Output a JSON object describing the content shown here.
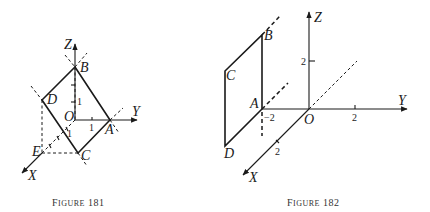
{
  "figure181": {
    "caption": "Figure 181",
    "axes": {
      "x": "X",
      "y": "Y",
      "z": "Z",
      "origin": "O"
    },
    "points": {
      "A": "A",
      "B": "B",
      "C": "C",
      "D": "D",
      "E": "E"
    },
    "ticks": {
      "z_one": "1",
      "y_one": "1",
      "x_one": "1"
    }
  },
  "figure182": {
    "caption": "Figure 182",
    "axes": {
      "x": "X",
      "y": "Y",
      "z": "Z",
      "origin": "O"
    },
    "points": {
      "A": "A",
      "B": "B",
      "C": "C",
      "D": "D"
    },
    "ticks": {
      "z_two": "2",
      "y_two": "2",
      "y_neg_two": "−2",
      "x_two": "2"
    }
  }
}
